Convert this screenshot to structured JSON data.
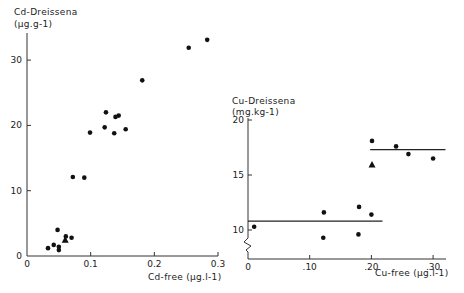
{
  "chart_data": [
    {
      "type": "scatter",
      "title": "",
      "ylabel": "Cd-Dreissena",
      "ylabel_unit": "(μg.g-1)",
      "xlabel": "Cd-free (μg.l-1)",
      "xlim": [
        0,
        0.3
      ],
      "ylim": [
        0,
        33
      ],
      "xticks": [
        "0",
        "0.1",
        "0.2",
        "0.3"
      ],
      "yticks": [
        "0",
        "10",
        "20",
        "30"
      ],
      "grid": false,
      "series": [
        {
          "name": "circles",
          "marker": "circle",
          "points": [
            [
              0.033,
              1.2
            ],
            [
              0.042,
              1.7
            ],
            [
              0.048,
              4.0
            ],
            [
              0.05,
              1.4
            ],
            [
              0.05,
              0.9
            ],
            [
              0.061,
              3.0
            ],
            [
              0.07,
              2.8
            ],
            [
              0.072,
              12.1
            ],
            [
              0.09,
              12.0
            ],
            [
              0.099,
              18.9
            ],
            [
              0.122,
              19.7
            ],
            [
              0.124,
              22.0
            ],
            [
              0.137,
              18.8
            ],
            [
              0.139,
              21.3
            ],
            [
              0.144,
              21.5
            ],
            [
              0.155,
              19.4
            ],
            [
              0.181,
              26.9
            ],
            [
              0.254,
              31.9
            ],
            [
              0.283,
              33.1
            ]
          ]
        },
        {
          "name": "triangle",
          "marker": "triangle",
          "points": [
            [
              0.06,
              2.4
            ]
          ]
        }
      ]
    },
    {
      "type": "scatter",
      "title": "",
      "ylabel": "Cu-Dreissena",
      "ylabel_unit": "(mg.kg-1)",
      "xlabel": "Cu-free (μg.l-1)",
      "xlim": [
        0,
        0.32
      ],
      "ylim": [
        8,
        20
      ],
      "y_axis_break": true,
      "xticks": [
        "0",
        ".10",
        ".20",
        ".30"
      ],
      "yticks": [
        "10",
        "15",
        "20"
      ],
      "grid": false,
      "series": [
        {
          "name": "circles",
          "marker": "circle",
          "points": [
            [
              0.01,
              10.3
            ],
            [
              0.123,
              11.6
            ],
            [
              0.122,
              9.3
            ],
            [
              0.18,
              12.1
            ],
            [
              0.179,
              9.6
            ],
            [
              0.2,
              11.4
            ],
            [
              0.201,
              18.1
            ],
            [
              0.24,
              17.6
            ],
            [
              0.26,
              16.9
            ],
            [
              0.3,
              16.5
            ]
          ]
        },
        {
          "name": "triangle",
          "marker": "triangle",
          "points": [
            [
              0.201,
              15.9
            ]
          ]
        }
      ],
      "reference_lines": [
        {
          "y": 10.8,
          "x_from": 0.0,
          "x_to": 0.218
        },
        {
          "y": 17.3,
          "x_from": 0.198,
          "x_to": 0.32
        }
      ]
    }
  ],
  "labels": {
    "left_ylabel": "Cd-Dreissena",
    "left_yunit": "(μg.g-1)",
    "left_xlabel": "Cd-free (μg.l-1)",
    "right_ylabel": "Cu-Dreissena",
    "right_yunit": "(mg.kg-1)",
    "right_xlabel": "Cu-free (μg.l-1)"
  }
}
